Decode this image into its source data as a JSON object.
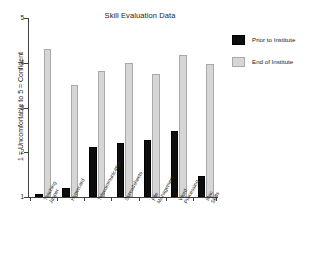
{
  "chart_data": {
    "type": "bar",
    "title": "Skill Evaluation Data",
    "xlabel": "",
    "ylabel": "1 = Uncomfortable to 5 = Confident",
    "ylim": [
      1,
      5
    ],
    "yticks": [
      "1",
      "2",
      "3",
      "4",
      "5"
    ],
    "grid": false,
    "legend_position": "right",
    "categories": [
      "Teaching Jasper",
      "Hypercard",
      "Telecommunication",
      "Spreadsheets",
      "File Management",
      "Word Processing",
      "Mac Skills"
    ],
    "category_lines": [
      [
        "Teaching",
        "Jasper"
      ],
      [
        "Hypercard",
        ""
      ],
      [
        "Telecommunication",
        ""
      ],
      [
        "Spreadsheets",
        ""
      ],
      [
        "File",
        "Management"
      ],
      [
        "Word",
        "Processing"
      ],
      [
        "Mac",
        "Skills"
      ]
    ],
    "series": [
      {
        "name": "Prior to Institute",
        "color": "#0d0d0d",
        "values": [
          1.06,
          1.2,
          2.11,
          2.2,
          2.28,
          2.48,
          1.48
        ]
      },
      {
        "name": "End of Institute",
        "color": "#d6d6d6",
        "values": [
          4.3,
          3.51,
          3.81,
          4.0,
          3.75,
          4.17,
          3.97
        ]
      }
    ]
  },
  "legend": {
    "items": [
      {
        "label": "Prior to Institute",
        "color": "#0d0d0d"
      },
      {
        "label": "End of Institute",
        "color": "#d6d6d6"
      }
    ]
  },
  "colors": {
    "prior": "#0d0d0d",
    "end": "#d6d6d6",
    "axis": "#404040",
    "background": "#ffffff"
  }
}
